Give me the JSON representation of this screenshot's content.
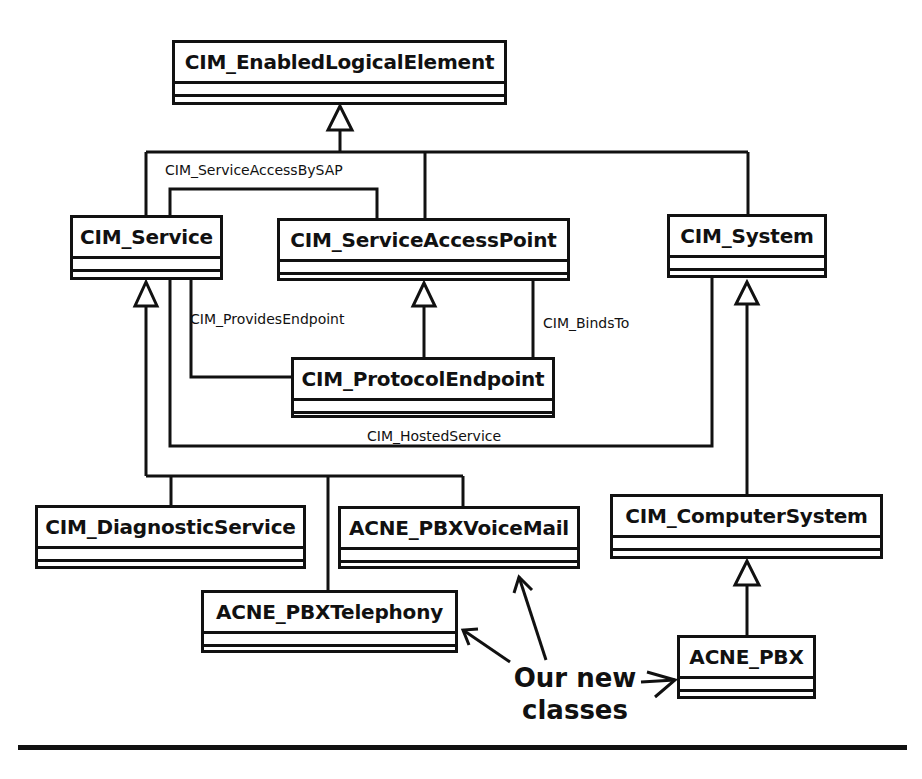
{
  "classes": {
    "enabled_logical_element": "CIM_EnabledLogicalElement",
    "service": "CIM_Service",
    "service_access_point": "CIM_ServiceAccessPoint",
    "system": "CIM_System",
    "protocol_endpoint": "CIM_ProtocolEndpoint",
    "diagnostic_service": "CIM_DiagnosticService",
    "pbx_voicemail": "ACNE_PBXVoiceMail",
    "pbx_telephony": "ACNE_PBXTelephony",
    "computer_system": "CIM_ComputerSystem",
    "pbx": "ACNE_PBX"
  },
  "associations": {
    "service_access_by_sap": "CIM_ServiceAccessBySAP",
    "provides_endpoint": "CIM_ProvidesEndpoint",
    "binds_to": "CIM_BindsTo",
    "hosted_service": "CIM_HostedService"
  },
  "callout": {
    "line1": "Our new",
    "line2": "classes"
  },
  "colors": {
    "stroke": "#111111",
    "background": "#ffffff"
  }
}
